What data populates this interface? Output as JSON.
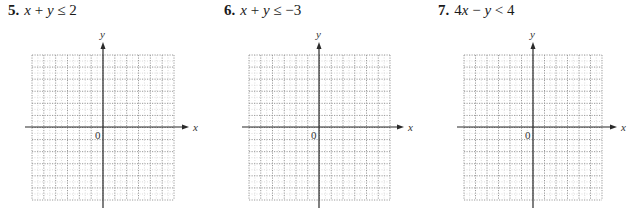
{
  "problems": [
    {
      "number": "5.",
      "expression": "x + y ≤ 2",
      "origin_label": "0",
      "x_axis_label": "x",
      "y_axis_label": "y",
      "layout": {
        "left": 0,
        "title_x": 8,
        "grid_left": 32,
        "grid_right": 174,
        "yaxis_x": 103,
        "xaxis_start": 25,
        "xaxis_end": 189
      }
    },
    {
      "number": "6.",
      "expression": "x + y ≤ −3",
      "origin_label": "0",
      "x_axis_label": "x",
      "y_axis_label": "y",
      "layout": {
        "left": 0,
        "title_x": 224,
        "grid_left": 249,
        "grid_right": 390,
        "yaxis_x": 319,
        "xaxis_start": 242,
        "xaxis_end": 404
      }
    },
    {
      "number": "7.",
      "expression": "4x − y < 4",
      "origin_label": "0",
      "x_axis_label": "x",
      "y_axis_label": "y",
      "layout": {
        "left": 0,
        "title_x": 438,
        "grid_left": 464,
        "grid_right": 602,
        "yaxis_x": 533,
        "xaxis_start": 457,
        "xaxis_end": 617
      }
    }
  ],
  "grid": {
    "top": 55,
    "bottom": 200,
    "xaxis_y": 127,
    "yaxis_top": 42,
    "yaxis_bottom": 208,
    "major_cells": 12,
    "major_color": "#9a9a9a",
    "minor_color": "#dcdcdc",
    "axis_color": "#2a2a2a"
  }
}
